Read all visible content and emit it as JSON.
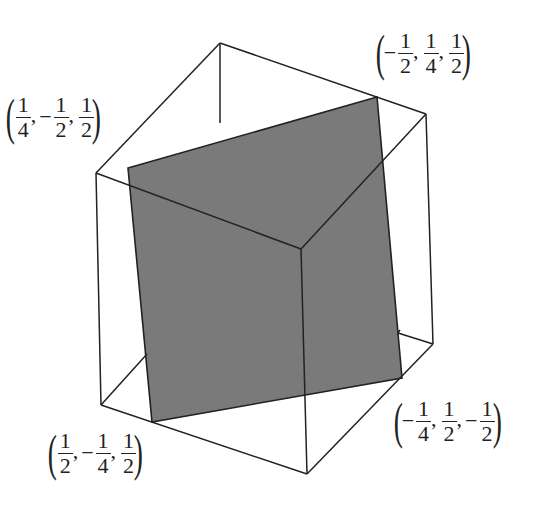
{
  "diagram": {
    "colors": {
      "edge": "#222222",
      "plane_fill": "#7a7a7a",
      "background": "#ffffff"
    },
    "labels": [
      {
        "id": "top-left",
        "coords": [
          {
            "sign": "",
            "num": "1",
            "den": "4"
          },
          {
            "sign": "−",
            "num": "1",
            "den": "2"
          },
          {
            "sign": "",
            "num": "1",
            "den": "2"
          }
        ]
      },
      {
        "id": "top-right",
        "coords": [
          {
            "sign": "−",
            "num": "1",
            "den": "2"
          },
          {
            "sign": "",
            "num": "1",
            "den": "4"
          },
          {
            "sign": "",
            "num": "1",
            "den": "2"
          }
        ]
      },
      {
        "id": "bottom-right",
        "coords": [
          {
            "sign": "−",
            "num": "1",
            "den": "4"
          },
          {
            "sign": "",
            "num": "1",
            "den": "2"
          },
          {
            "sign": "−",
            "num": "1",
            "den": "2"
          }
        ]
      },
      {
        "id": "bottom-left",
        "coords": [
          {
            "sign": "",
            "num": "1",
            "den": "2"
          },
          {
            "sign": "−",
            "num": "1",
            "den": "4"
          },
          {
            "sign": "",
            "num": "1",
            "den": "2"
          }
        ]
      }
    ]
  }
}
